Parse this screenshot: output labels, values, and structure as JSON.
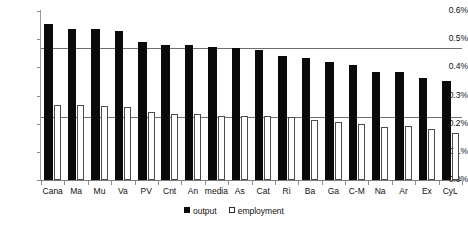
{
  "chart_data": {
    "type": "bar",
    "title": "",
    "subtitle": "",
    "xlabel": "",
    "ylabel": "",
    "ylim": [
      0.0,
      0.6
    ],
    "ytick_labels": [
      "0.6%",
      "0.5%",
      "0.4%",
      "0.3%",
      "0.2%",
      "0.1%",
      "0.0%"
    ],
    "ytick_values": [
      0.6,
      0.5,
      0.4,
      0.3,
      0.2,
      0.1,
      0.0
    ],
    "grid": false,
    "legend_position": "bottom",
    "value_unit": "%",
    "categories": [
      "Cana",
      "Ma",
      "Mu",
      "Va",
      "PV",
      "Cnt",
      "An",
      "media",
      "As",
      "Cat",
      "Ri",
      "Ba",
      "Ga",
      "C-M",
      "Na",
      "Ar",
      "Ex",
      "CyL"
    ],
    "series": [
      {
        "name": "output",
        "color": "#0a0a0a",
        "values": [
          0.555,
          0.535,
          0.535,
          0.53,
          0.49,
          0.48,
          0.478,
          0.472,
          0.47,
          0.462,
          0.44,
          0.432,
          0.42,
          0.41,
          0.385,
          0.383,
          0.362,
          0.352
        ]
      },
      {
        "name": "employment",
        "color": "#ffffff",
        "values": [
          0.268,
          0.265,
          0.262,
          0.26,
          0.24,
          0.234,
          0.233,
          0.228,
          0.228,
          0.228,
          0.222,
          0.212,
          0.205,
          0.198,
          0.188,
          0.19,
          0.182,
          0.168
        ]
      }
    ],
    "reference_lines": [
      {
        "name": "output-average",
        "value": 0.468
      },
      {
        "name": "employment-average",
        "value": 0.222
      }
    ],
    "legend": [
      {
        "label": "output",
        "marker": "filled-square"
      },
      {
        "label": "employment",
        "marker": "hollow-square"
      }
    ]
  }
}
